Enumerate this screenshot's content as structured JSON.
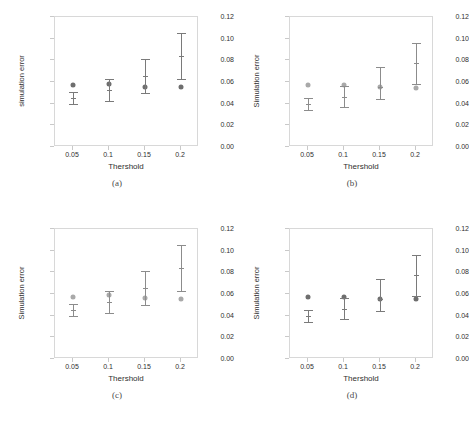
{
  "figure": {
    "panel_count": 4,
    "layout": "2x2"
  },
  "axis": {
    "ylabel_lower": "simulation error",
    "ylabel_upper": "Simulation error",
    "xlabel": "Thershold",
    "yticks": [
      "0.00",
      "0.02",
      "0.04",
      "0.06",
      "0.08",
      "0.10",
      "0.12"
    ],
    "ytick_values": [
      0.0,
      0.02,
      0.04,
      0.06,
      0.08,
      0.1,
      0.12
    ],
    "xticks": [
      "0.05",
      "0.1",
      "0.15",
      "0.2"
    ]
  },
  "captions": {
    "a": "(a)",
    "b": "(b)",
    "c": "(c)",
    "d": "(d)"
  },
  "colors": {
    "marker_dark": "#6e6e6e",
    "marker_light": "#a9a9a9",
    "errorbar_dark": "#7a7a7a",
    "errorbar_light": "#8c8c8c",
    "frame": "#d8d8d8",
    "text": "#2f2f2f",
    "background": "#ffffff"
  },
  "chart_data": [
    {
      "type": "scatter",
      "panel": "(a)",
      "title": "",
      "xlabel": "Thershold",
      "ylabel": "simulation error",
      "categories": [
        "0.05",
        "0.1",
        "0.15",
        "0.2"
      ],
      "x": [
        0.05,
        0.1,
        0.15,
        0.2
      ],
      "ylim": [
        0.0,
        0.12
      ],
      "xlim": [
        0.025,
        0.225
      ],
      "grid": false,
      "legend": "none",
      "series": [
        {
          "name": "reference-dot",
          "marker": "filled-circle",
          "color": "#6e6e6e",
          "values": [
            0.057,
            0.058,
            0.0555,
            0.0555
          ]
        },
        {
          "name": "errorbar-mean",
          "marker": "errorbar",
          "color": "#7a7a7a",
          "values": [
            0.0455,
            0.0525,
            0.0655,
            0.084
          ],
          "lower": [
            0.04,
            0.0425,
            0.05,
            0.063
          ],
          "upper": [
            0.051,
            0.063,
            0.0815,
            0.105
          ]
        }
      ]
    },
    {
      "type": "scatter",
      "panel": "(b)",
      "title": "",
      "xlabel": "Thershold",
      "ylabel": "Simulation error",
      "categories": [
        "0.05",
        "0.1",
        "0.15",
        "0.2"
      ],
      "x": [
        0.05,
        0.1,
        0.15,
        0.2
      ],
      "ylim": [
        0.0,
        0.12
      ],
      "xlim": [
        0.025,
        0.225
      ],
      "grid": false,
      "legend": "none",
      "series": [
        {
          "name": "reference-dot",
          "marker": "filled-circle",
          "color": "#a9a9a9",
          "values": [
            0.057,
            0.057,
            0.0555,
            0.0545
          ]
        },
        {
          "name": "errorbar-mean",
          "marker": "errorbar",
          "color": "#8c8c8c",
          "values": [
            0.04,
            0.0465,
            0.0555,
            0.0775
          ],
          "lower": [
            0.034,
            0.0365,
            0.0445,
            0.0585
          ],
          "upper": [
            0.0455,
            0.0565,
            0.0735,
            0.096
          ]
        }
      ]
    },
    {
      "type": "scatter",
      "panel": "(c)",
      "title": "",
      "xlabel": "Thershold",
      "ylabel": "Simulation error",
      "categories": [
        "0.05",
        "0.1",
        "0.15",
        "0.2"
      ],
      "x": [
        0.05,
        0.1,
        0.15,
        0.2
      ],
      "ylim": [
        0.0,
        0.12
      ],
      "xlim": [
        0.025,
        0.225
      ],
      "grid": false,
      "legend": "none",
      "series": [
        {
          "name": "reference-dot",
          "marker": "filled-circle",
          "color": "#a9a9a9",
          "values": [
            0.057,
            0.059,
            0.0565,
            0.0555
          ]
        },
        {
          "name": "errorbar-mean",
          "marker": "errorbar",
          "color": "#8c8c8c",
          "values": [
            0.0455,
            0.053,
            0.0655,
            0.084
          ],
          "lower": [
            0.04,
            0.0425,
            0.05,
            0.063
          ],
          "upper": [
            0.051,
            0.063,
            0.0815,
            0.105
          ]
        }
      ]
    },
    {
      "type": "scatter",
      "panel": "(d)",
      "title": "",
      "xlabel": "Thershold",
      "ylabel": "Simulation error",
      "categories": [
        "0.05",
        "0.1",
        "0.15",
        "0.2"
      ],
      "x": [
        0.05,
        0.1,
        0.15,
        0.2
      ],
      "ylim": [
        0.0,
        0.12
      ],
      "xlim": [
        0.025,
        0.225
      ],
      "grid": false,
      "legend": "none",
      "series": [
        {
          "name": "reference-dot",
          "marker": "filled-circle",
          "color": "#6e6e6e",
          "values": [
            0.057,
            0.0575,
            0.0555,
            0.055
          ]
        },
        {
          "name": "errorbar-mean",
          "marker": "errorbar",
          "color": "#7a7a7a",
          "values": [
            0.04,
            0.0465,
            0.0555,
            0.0775
          ],
          "lower": [
            0.034,
            0.0365,
            0.0445,
            0.0585
          ],
          "upper": [
            0.0455,
            0.0565,
            0.0735,
            0.096
          ]
        }
      ]
    }
  ]
}
